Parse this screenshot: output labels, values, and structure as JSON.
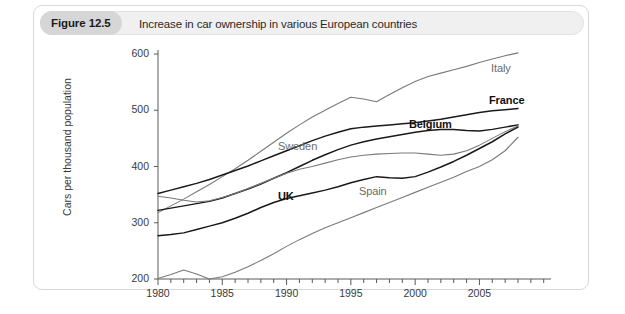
{
  "figure": {
    "badge": "Figure 12.5",
    "caption": "Increase in car ownership in various European countries"
  },
  "chart_data": {
    "type": "line",
    "title": "Increase in car ownership in various European countries",
    "xlabel": "",
    "ylabel": "Cars per thousand population",
    "xlim": [
      1980,
      2008
    ],
    "ylim": [
      200,
      600
    ],
    "xticks": [
      1980,
      1985,
      1990,
      1995,
      2000,
      2005
    ],
    "xtick_labels": [
      "1980",
      "1985",
      "1990",
      "1995",
      "2000",
      "2005"
    ],
    "yticks": [
      200,
      300,
      400,
      500,
      600
    ],
    "ytick_labels": [
      "200",
      "300",
      "400",
      "500",
      "600"
    ],
    "minor_xticks": "annual",
    "grid": false,
    "legend": "inline-labels",
    "x": [
      1980,
      1981,
      1982,
      1983,
      1984,
      1985,
      1986,
      1987,
      1988,
      1989,
      1990,
      1991,
      1992,
      1993,
      1994,
      1995,
      1996,
      1997,
      1998,
      1999,
      2000,
      2001,
      2002,
      2003,
      2004,
      2005,
      2006,
      2007,
      2008
    ],
    "series": [
      {
        "name": "Italy",
        "color": "#7a7a7a",
        "weight": "normal",
        "label_x": 490,
        "label_y": 56,
        "values": [
          318,
          330,
          342,
          355,
          368,
          382,
          396,
          411,
          427,
          443,
          459,
          474,
          488,
          500,
          512,
          523,
          520,
          515,
          528,
          540,
          551,
          560,
          566,
          572,
          578,
          585,
          591,
          597,
          602
        ]
      },
      {
        "name": "France",
        "color": "#1a1a1a",
        "weight": "bold",
        "label_x": 488,
        "label_y": 88,
        "values": [
          352,
          358,
          364,
          370,
          377,
          385,
          393,
          401,
          410,
          419,
          428,
          437,
          446,
          454,
          461,
          467,
          470,
          472,
          474,
          476,
          478,
          481,
          484,
          488,
          492,
          496,
          499,
          501,
          503
        ]
      },
      {
        "name": "Belgium",
        "color": "#1a1a1a",
        "weight": "bold",
        "label_x": 408,
        "label_y": 112,
        "values": [
          322,
          326,
          330,
          334,
          338,
          344,
          352,
          360,
          369,
          379,
          389,
          400,
          411,
          421,
          430,
          438,
          444,
          449,
          453,
          457,
          461,
          464,
          466,
          466,
          464,
          463,
          466,
          470,
          474
        ]
      },
      {
        "name": "Sweden",
        "color": "#7a7a7a",
        "weight": "normal",
        "label_x": 277,
        "label_y": 134,
        "values": [
          347,
          344,
          340,
          337,
          339,
          345,
          352,
          361,
          370,
          379,
          388,
          395,
          400,
          406,
          412,
          417,
          420,
          422,
          423,
          424,
          424,
          422,
          420,
          422,
          428,
          438,
          450,
          462,
          472
        ]
      },
      {
        "name": "UK",
        "color": "#1a1a1a",
        "weight": "bold",
        "label_x": 277,
        "label_y": 184,
        "values": [
          277,
          279,
          282,
          288,
          294,
          300,
          308,
          317,
          327,
          336,
          343,
          348,
          353,
          358,
          364,
          371,
          377,
          382,
          380,
          379,
          382,
          390,
          399,
          409,
          420,
          432,
          444,
          458,
          470
        ]
      },
      {
        "name": "Spain",
        "color": "#7a7a7a",
        "weight": "normal",
        "label_x": 358,
        "label_y": 179,
        "values": [
          201,
          208,
          216,
          209,
          200,
          204,
          212,
          222,
          233,
          245,
          258,
          270,
          281,
          291,
          300,
          309,
          318,
          327,
          336,
          345,
          354,
          363,
          372,
          381,
          391,
          400,
          412,
          428,
          452
        ]
      }
    ]
  }
}
